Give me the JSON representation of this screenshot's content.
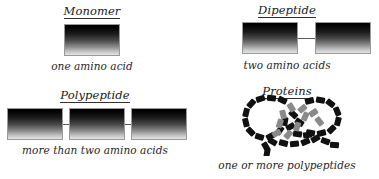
{
  "figure": {
    "background_color": "#ffffff",
    "ink_color": "#1a1a1a"
  },
  "panels": [
    {
      "id": "monomer",
      "title": "Monomer",
      "caption": "one amino acid",
      "unit_count": 1,
      "icon": "gradient-block-chain"
    },
    {
      "id": "dipeptide",
      "title": "Dipeptide",
      "caption": "two amino acids",
      "unit_count": 2,
      "icon": "gradient-block-chain"
    },
    {
      "id": "polypeptide",
      "title": "Polypeptide",
      "caption": "more than two amino acids",
      "unit_count": 3,
      "icon": "gradient-block-chain"
    },
    {
      "id": "proteins",
      "title": "Proteins",
      "caption": "one or more polypeptides",
      "unit_count": 0,
      "icon": "folded-polypeptide-tangle"
    }
  ],
  "style": {
    "block_gradient_top": "#000000",
    "block_gradient_bottom": "#e3e3e3",
    "block_border": "#9a9a9a",
    "link_color": "#5b5b5b",
    "bead_dark": "#111111",
    "bead_mid": "#8a8a8a"
  }
}
